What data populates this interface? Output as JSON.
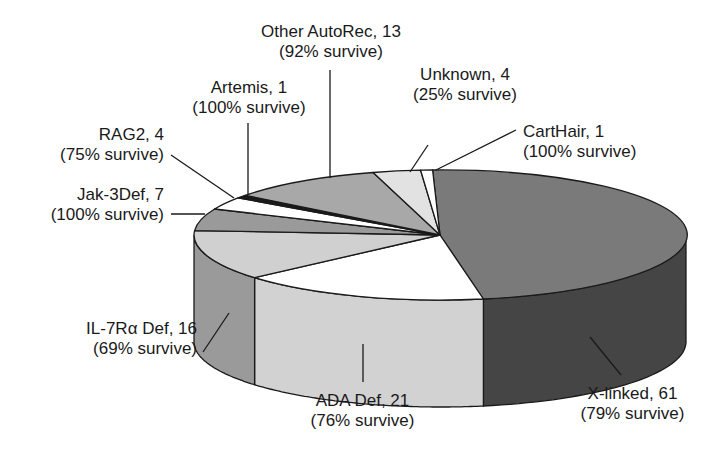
{
  "chart_data": {
    "type": "pie",
    "style": "3d",
    "title": "",
    "total": 128,
    "slices": [
      {
        "key": "xlinked",
        "label": "X-linked, 61",
        "sub": "(79% survive)",
        "name": "X-linked",
        "value": 61,
        "survival_pct": 79,
        "top": "#7a7a7a",
        "side": "#454545"
      },
      {
        "key": "ada",
        "label": "ADA Def, 21",
        "sub": "(76% survive)",
        "name": "ADA Def",
        "value": 21,
        "survival_pct": 76,
        "top": "#ffffff",
        "side": "#d2d2d2"
      },
      {
        "key": "il7",
        "label": "IL-7Rα Def, 16",
        "sub": "(69% survive)",
        "name": "IL-7Rα Def",
        "value": 16,
        "survival_pct": 69,
        "top": "#d0d0d0",
        "side": "#9a9a9a"
      },
      {
        "key": "jak3",
        "label": "Jak-3Def, 7",
        "sub": "(100% survive)",
        "name": "Jak-3Def",
        "value": 7,
        "survival_pct": 100,
        "top": "#9a9a9a",
        "side": "#6a6a6a"
      },
      {
        "key": "rag2",
        "label": "RAG2, 4",
        "sub": "(75% survive)",
        "name": "RAG2",
        "value": 4,
        "survival_pct": 75,
        "top": "#ffffff",
        "side": "#d0d0d0"
      },
      {
        "key": "artemis",
        "label": "Artemis, 1",
        "sub": "(100% survive)",
        "name": "Artemis",
        "value": 1,
        "survival_pct": 100,
        "top": "#1a1a1a",
        "side": "#111111"
      },
      {
        "key": "other",
        "label": "Other AutoRec, 13",
        "sub": "(92% survive)",
        "name": "Other AutoRec",
        "value": 13,
        "survival_pct": 92,
        "top": "#a8a8a8",
        "side": "#777777"
      },
      {
        "key": "unknown",
        "label": "Unknown, 4",
        "sub": "(25% survive)",
        "name": "Unknown",
        "value": 4,
        "survival_pct": 25,
        "top": "#e2e2e2",
        "side": "#b0b0b0"
      },
      {
        "key": "carthair",
        "label": "CartHair, 1",
        "sub": "(100% survive)",
        "name": "CartHair",
        "value": 1,
        "survival_pct": 100,
        "top": "#ffffff",
        "side": "#d0d0d0"
      }
    ]
  },
  "labels": {
    "other": {
      "line1": "Other AutoRec, 13",
      "line2": "(92% survive)"
    },
    "artemis": {
      "line1": "Artemis, 1",
      "line2": "(100% survive)"
    },
    "unknown": {
      "line1": "Unknown, 4",
      "line2": "(25% survive)"
    },
    "carthair": {
      "line1": "CartHair, 1",
      "line2": "(100% survive)"
    },
    "rag2": {
      "line1": "RAG2, 4",
      "line2": "(75% survive)"
    },
    "jak3": {
      "line1": "Jak-3Def, 7",
      "line2": "(100% survive)"
    },
    "il7": {
      "line1": "IL-7Rα Def, 16",
      "line2": "(69% survive)"
    },
    "ada": {
      "line1": "ADA Def, 21",
      "line2": "(76% survive)"
    },
    "xlinked": {
      "line1": "X-linked, 61",
      "line2": "(79% survive)"
    }
  }
}
